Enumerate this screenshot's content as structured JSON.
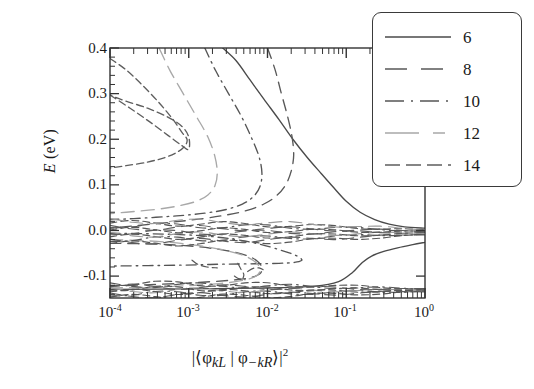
{
  "chart_data": {
    "type": "line",
    "title": "",
    "xlabel": "|⟨φkL | φ−kR⟩|²",
    "ylabel": "E (eV)",
    "xscale": "log",
    "xlim": [
      0.0001,
      1
    ],
    "ylim": [
      -0.148,
      0.4
    ],
    "grid": false,
    "legend_position": "top-right",
    "xticks": [
      "10⁻⁴",
      "10⁻³",
      "10⁻²",
      "10⁻¹",
      "10⁰"
    ],
    "xtick_values": [
      0.0001,
      0.001,
      0.01,
      0.1,
      1
    ],
    "yticks": [
      "0.4",
      "0.3",
      "0.2",
      "0.1",
      "0.0",
      "-0.1"
    ],
    "ytick_values": [
      0.4,
      0.3,
      0.2,
      0.1,
      0.0,
      -0.1
    ],
    "series": [
      {
        "name": "6",
        "label": "6",
        "style": "solid",
        "color": "#4a4a4a",
        "points_upper": [
          [
            0.0027,
            0.4
          ],
          [
            0.004,
            0.372
          ],
          [
            0.006,
            0.33
          ],
          [
            0.009,
            0.288
          ],
          [
            0.014,
            0.243
          ],
          [
            0.021,
            0.2
          ],
          [
            0.032,
            0.16
          ],
          [
            0.048,
            0.125
          ],
          [
            0.07,
            0.093
          ],
          [
            0.1,
            0.064
          ],
          [
            0.15,
            0.04
          ],
          [
            0.23,
            0.024
          ],
          [
            0.35,
            0.014
          ],
          [
            0.55,
            0.008
          ],
          [
            1.0,
            0.005
          ]
        ],
        "points_lower": [
          [
            0.0001,
            -0.129
          ],
          [
            0.001,
            -0.128
          ],
          [
            0.01,
            -0.126
          ],
          [
            0.04,
            -0.122
          ],
          [
            0.08,
            -0.112
          ],
          [
            0.12,
            -0.092
          ],
          [
            0.16,
            -0.07
          ],
          [
            0.21,
            -0.056
          ],
          [
            0.3,
            -0.046
          ],
          [
            0.45,
            -0.038
          ],
          [
            0.7,
            -0.031
          ],
          [
            1.0,
            -0.026
          ]
        ]
      },
      {
        "name": "8",
        "label": "8",
        "style": "dashed-long",
        "color": "#585858",
        "points_upper": [
          [
            0.01,
            0.4
          ],
          [
            0.0125,
            0.352
          ],
          [
            0.015,
            0.3
          ],
          [
            0.018,
            0.25
          ],
          [
            0.0205,
            0.205
          ],
          [
            0.0215,
            0.165
          ],
          [
            0.02,
            0.13
          ],
          [
            0.017,
            0.1
          ],
          [
            0.013,
            0.076
          ],
          [
            0.009,
            0.058
          ],
          [
            0.0055,
            0.044
          ],
          [
            0.003,
            0.034
          ],
          [
            0.0015,
            0.026
          ],
          [
            0.0006,
            0.018
          ],
          [
            0.0002,
            0.01
          ],
          [
            0.0001,
            0.005
          ]
        ],
        "points_lower": [
          [
            0.0001,
            -0.028
          ],
          [
            0.0004,
            -0.03
          ],
          [
            0.0012,
            -0.035
          ],
          [
            0.003,
            -0.044
          ],
          [
            0.0055,
            -0.055
          ],
          [
            0.0075,
            -0.068
          ],
          [
            0.0085,
            -0.082
          ],
          [
            0.008,
            -0.095
          ],
          [
            0.0062,
            -0.103
          ],
          [
            0.004,
            -0.108
          ],
          [
            0.002,
            -0.112
          ],
          [
            0.0008,
            -0.116
          ],
          [
            0.0002,
            -0.12
          ],
          [
            0.0001,
            -0.122
          ]
        ]
      },
      {
        "name": "10",
        "label": "10",
        "style": "dash-dot",
        "color": "#555555",
        "points_upper": [
          [
            0.0016,
            0.4
          ],
          [
            0.0022,
            0.35
          ],
          [
            0.0032,
            0.3
          ],
          [
            0.0046,
            0.252
          ],
          [
            0.0062,
            0.205
          ],
          [
            0.0078,
            0.162
          ],
          [
            0.0085,
            0.125
          ],
          [
            0.008,
            0.096
          ],
          [
            0.0066,
            0.074
          ],
          [
            0.0048,
            0.058
          ],
          [
            0.003,
            0.046
          ],
          [
            0.0016,
            0.038
          ],
          [
            0.0007,
            0.032
          ],
          [
            0.0002,
            0.026
          ],
          [
            0.0001,
            0.024
          ]
        ],
        "points_lower": [
          [
            0.0001,
            -0.006
          ],
          [
            0.0005,
            -0.008
          ],
          [
            0.0016,
            -0.012
          ],
          [
            0.004,
            -0.02
          ],
          [
            0.008,
            -0.03
          ],
          [
            0.014,
            -0.042
          ],
          [
            0.021,
            -0.052
          ],
          [
            0.026,
            -0.06
          ],
          [
            0.027,
            -0.066
          ],
          [
            0.022,
            -0.07
          ],
          [
            0.014,
            -0.072
          ],
          [
            0.007,
            -0.073
          ],
          [
            0.0025,
            -0.074
          ],
          [
            0.0008,
            -0.076
          ],
          [
            0.0001,
            -0.078
          ]
        ]
      },
      {
        "name": "12",
        "label": "12",
        "style": "dashed-light",
        "color": "#a8a8a8",
        "points_upper": [
          [
            0.00042,
            0.4
          ],
          [
            0.00058,
            0.35
          ],
          [
            0.00085,
            0.3
          ],
          [
            0.00125,
            0.25
          ],
          [
            0.00175,
            0.205
          ],
          [
            0.00215,
            0.162
          ],
          [
            0.0023,
            0.126
          ],
          [
            0.00215,
            0.098
          ],
          [
            0.00175,
            0.078
          ],
          [
            0.00125,
            0.064
          ],
          [
            0.00075,
            0.054
          ],
          [
            0.00038,
            0.046
          ],
          [
            0.00016,
            0.04
          ],
          [
            0.0001,
            0.037
          ]
        ],
        "points_lower": [
          [
            0.0001,
            -0.02
          ],
          [
            0.0004,
            -0.024
          ],
          [
            0.0012,
            -0.032
          ],
          [
            0.003,
            -0.044
          ],
          [
            0.0055,
            -0.058
          ],
          [
            0.0075,
            -0.074
          ],
          [
            0.008,
            -0.09
          ],
          [
            0.0068,
            -0.102
          ],
          [
            0.0046,
            -0.11
          ],
          [
            0.0026,
            -0.116
          ],
          [
            0.0012,
            -0.12
          ],
          [
            0.0004,
            -0.124
          ],
          [
            0.0001,
            -0.126
          ]
        ]
      },
      {
        "name": "14",
        "label": "14",
        "style": "dashed",
        "color": "#5e5e5e",
        "points_upper": [
          [
            0.0001,
            0.377
          ],
          [
            0.00016,
            0.352
          ],
          [
            0.00026,
            0.318
          ],
          [
            0.00042,
            0.28
          ],
          [
            0.00062,
            0.245
          ],
          [
            0.00082,
            0.215
          ],
          [
            0.00095,
            0.2
          ],
          [
            0.0009,
            0.186
          ],
          [
            0.00072,
            0.172
          ],
          [
            0.0005,
            0.16
          ],
          [
            0.0003,
            0.15
          ],
          [
            0.00016,
            0.142
          ],
          [
            0.0001,
            0.137
          ]
        ],
        "points_lower": [
          [
            0.0001,
            0.297
          ],
          [
            0.00018,
            0.268
          ],
          [
            0.00032,
            0.238
          ],
          [
            0.00055,
            0.208
          ],
          [
            0.00082,
            0.186
          ],
          [
            0.001,
            0.178
          ],
          [
            0.001,
            0.205
          ],
          [
            0.00082,
            0.228
          ],
          [
            0.00055,
            0.248
          ],
          [
            0.0003,
            0.268
          ],
          [
            0.00015,
            0.285
          ],
          [
            0.0001,
            0.297
          ]
        ]
      }
    ],
    "annotations": [
      "Dense overlapping dashed contours cluster near E = 0.00 eV across the full x range.",
      "A second dense band of dashed contours lies near the bottom edge, E ≈ -0.13 eV.",
      "All branches converge toward the right edge at x = 10⁰."
    ]
  },
  "legend": {
    "entries": [
      {
        "label": "6",
        "style": "solid"
      },
      {
        "label": "8",
        "style": "dashed-long"
      },
      {
        "label": "10",
        "style": "dash-dot"
      },
      {
        "label": "12",
        "style": "dashed-light"
      },
      {
        "label": "14",
        "style": "dashed"
      }
    ]
  },
  "axes": {
    "y_label_main": "E",
    "y_label_unit": " (eV)",
    "x_label_parts": {
      "bar_open": "|⟨",
      "phi1": "φ",
      "sub1": "kL",
      "mid": " | ",
      "phi2": "φ",
      "sub2": "−kR",
      "bar_close": "⟩|",
      "exp": "2"
    },
    "yticks": [
      "0.4",
      "0.3",
      "0.2",
      "0.1",
      "0.0",
      "-0.1"
    ],
    "xticks": [
      {
        "mantissa": "10",
        "exp": "-4"
      },
      {
        "mantissa": "10",
        "exp": "-3"
      },
      {
        "mantissa": "10",
        "exp": "-2"
      },
      {
        "mantissa": "10",
        "exp": "-1"
      },
      {
        "mantissa": "10",
        "exp": "0"
      }
    ]
  }
}
